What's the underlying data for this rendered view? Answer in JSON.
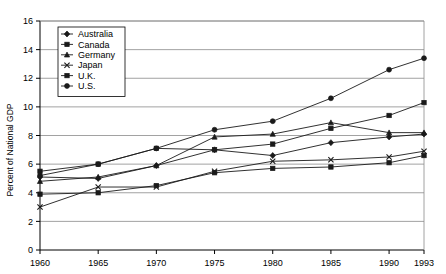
{
  "chart_data": {
    "type": "line",
    "title": "",
    "xlabel": "",
    "ylabel": "Percent of National GDP",
    "x": [
      1960,
      1965,
      1970,
      1975,
      1980,
      1985,
      1990,
      1993
    ],
    "xtick_labels": [
      "1960",
      "1965",
      "1970",
      "1975",
      "1980",
      "1985",
      "1990",
      "1993"
    ],
    "ytick_labels": [
      "0",
      "2",
      "4",
      "6",
      "8",
      "10",
      "12",
      "14",
      "16"
    ],
    "yticks": [
      0,
      2,
      4,
      6,
      8,
      10,
      12,
      14,
      16
    ],
    "ylim": [
      0,
      16
    ],
    "xlim": [
      1960,
      1993
    ],
    "grid": "horizontal",
    "legend_position": "upper-left-inside",
    "series": [
      {
        "name": "Australia",
        "marker": "diamond",
        "values": [
          5.1,
          5.0,
          5.9,
          7.0,
          6.6,
          7.5,
          7.9,
          8.1
        ]
      },
      {
        "name": "Canada",
        "marker": "square",
        "values": [
          5.5,
          6.0,
          7.1,
          7.0,
          7.4,
          8.5,
          9.4,
          10.3
        ]
      },
      {
        "name": "Germany",
        "marker": "triangle",
        "values": [
          4.8,
          5.1,
          5.9,
          7.9,
          8.1,
          8.9,
          8.2,
          8.2
        ]
      },
      {
        "name": "Japan",
        "marker": "cross",
        "values": [
          3.0,
          4.4,
          4.4,
          5.5,
          6.2,
          6.3,
          6.5,
          6.9
        ]
      },
      {
        "name": "U.K.",
        "marker": "square",
        "values": [
          3.9,
          4.0,
          4.5,
          5.4,
          5.7,
          5.8,
          6.1,
          6.6
        ]
      },
      {
        "name": "U.S.",
        "marker": "circle",
        "values": [
          5.2,
          6.0,
          7.1,
          8.4,
          9.0,
          10.6,
          12.6,
          13.4
        ]
      }
    ]
  }
}
